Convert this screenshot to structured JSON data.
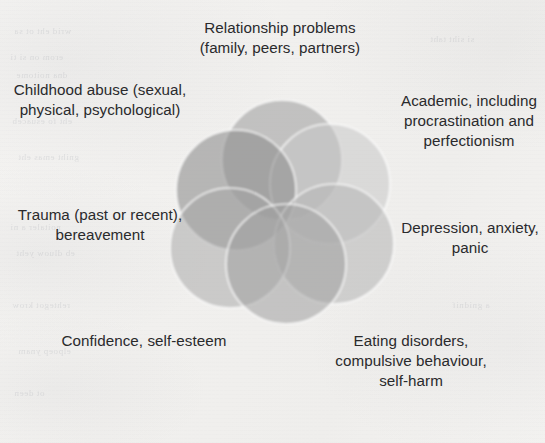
{
  "figure": {
    "type": "venn-diagram",
    "title": "",
    "background_color": "#f3f2f0",
    "text_color": "#2a2a2c"
  },
  "labels": [
    {
      "id": "relationship",
      "name": "label-relationship-problems",
      "text": "Relationship problems (family, peers, partners)",
      "position": "top"
    },
    {
      "id": "childhood",
      "name": "label-childhood-abuse",
      "text": "Childhood abuse (sexual, physical, psychological)",
      "position": "top-left"
    },
    {
      "id": "academic",
      "name": "label-academic",
      "text": "Academic, including procrastination and perfectionism",
      "position": "top-right"
    },
    {
      "id": "trauma",
      "name": "label-trauma",
      "text": "Trauma (past or recent), bereavement",
      "position": "left"
    },
    {
      "id": "depression",
      "name": "label-depression",
      "text": "Depression, anxiety, panic",
      "position": "right"
    },
    {
      "id": "confidence",
      "name": "label-confidence",
      "text": "Confidence, self-esteem",
      "position": "bottom-left"
    },
    {
      "id": "eating",
      "name": "label-eating-disorders",
      "text": "Eating disorders, compulsive behaviour, self-harm",
      "position": "bottom-right"
    }
  ],
  "diagram": {
    "stroke_color": "#ffffff",
    "circles": [
      {
        "id": "c1",
        "name": "circle-relationship",
        "cx": 112,
        "cy": 62,
        "r": 60,
        "fill": "#9a9a9a",
        "opacity": 0.55
      },
      {
        "id": "c2",
        "name": "circle-academic",
        "cx": 160,
        "cy": 86,
        "r": 60,
        "fill": "#c9c9c9",
        "opacity": 0.55
      },
      {
        "id": "c3",
        "name": "circle-childhood",
        "cx": 66,
        "cy": 92,
        "r": 60,
        "fill": "#8f8f8f",
        "opacity": 0.6
      },
      {
        "id": "c4",
        "name": "circle-depression",
        "cx": 164,
        "cy": 146,
        "r": 60,
        "fill": "#b4b4b4",
        "opacity": 0.55
      },
      {
        "id": "c5",
        "name": "circle-trauma",
        "cx": 60,
        "cy": 150,
        "r": 60,
        "fill": "#a6a6a6",
        "opacity": 0.5
      },
      {
        "id": "c6",
        "name": "circle-confidence",
        "cx": 116,
        "cy": 166,
        "r": 60,
        "fill": "#a0a0a0",
        "opacity": 0.55
      }
    ]
  },
  "ghost_text": [
    {
      "text": "wrid eht ot sa",
      "x": 14,
      "y": 26
    },
    {
      "text": "erom on si ti",
      "x": 10,
      "y": 52
    },
    {
      "text": "dna noitome",
      "x": 16,
      "y": 70
    },
    {
      "text": "eht fo esuaceb",
      "x": 12,
      "y": 116
    },
    {
      "text": "gniht emas eht",
      "x": 18,
      "y": 152
    },
    {
      "text": "noitaler a ni",
      "x": 10,
      "y": 222
    },
    {
      "text": "eb dluow yeht",
      "x": 16,
      "y": 248
    },
    {
      "text": "rehtegot krow",
      "x": 12,
      "y": 300
    },
    {
      "text": "elpoep ynam",
      "x": 18,
      "y": 346
    },
    {
      "text": "ot deen",
      "x": 14,
      "y": 388
    },
    {
      "text": "si siht taht",
      "x": 430,
      "y": 34
    },
    {
      "text": "a gnidnif",
      "x": 452,
      "y": 300
    }
  ]
}
